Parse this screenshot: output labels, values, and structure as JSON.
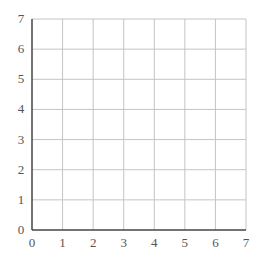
{
  "chart_data": {
    "type": "scatter",
    "title": "",
    "xlabel": "",
    "ylabel": "",
    "xlim": [
      0,
      7
    ],
    "ylim": [
      0,
      7
    ],
    "x_ticks": [
      "0",
      "1",
      "2",
      "3",
      "4",
      "5",
      "6",
      "7"
    ],
    "y_ticks": [
      "0",
      "1",
      "2",
      "3",
      "4",
      "5",
      "6",
      "7"
    ],
    "grid": true,
    "series": [],
    "legend": null
  },
  "colors": {
    "grid": "#c4c4c4",
    "axis": "#444444",
    "tick_text": "#555555",
    "background": "#ffffff"
  }
}
